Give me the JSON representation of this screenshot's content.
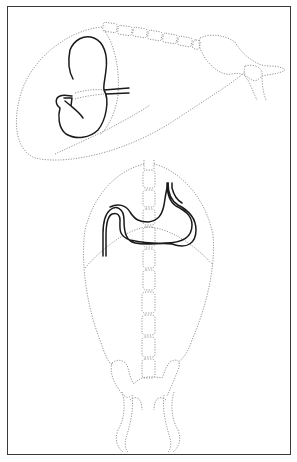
{
  "figure": {
    "type": "anatomical-line-diagram",
    "views": [
      {
        "name": "lateral-view",
        "structures": [
          "abdominal-outline",
          "lumbar-vertebrae",
          "pelvis",
          "femur",
          "stomach",
          "esophagus"
        ]
      },
      {
        "name": "ventrodorsal-view",
        "structures": [
          "abdominal-outline",
          "diaphragm",
          "vertebral-column",
          "pelvis",
          "femurs",
          "stomach",
          "esophagus"
        ]
      }
    ],
    "colors": {
      "border": "#3a3a3a",
      "organ_outline": "#1a1a1a",
      "dotted_outline": "#8a8a8a",
      "background": "#ffffff"
    },
    "labels": []
  }
}
